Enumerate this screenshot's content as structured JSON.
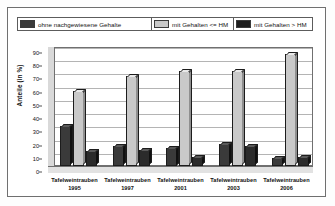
{
  "chart_data": {
    "type": "bar",
    "title": "",
    "subtitle": "",
    "xlabel": "",
    "ylabel": "Anteile (in %)",
    "ylim": [
      0,
      90
    ],
    "yticks": [
      0,
      10,
      20,
      30,
      40,
      50,
      60,
      70,
      80,
      90
    ],
    "grid": true,
    "legend_position": "top",
    "categories": [
      "Tafelweintrauben 1995",
      "Tafelweintrauben 1997",
      "Tafelweintrauben 2001",
      "Tafelweintrauben 2003",
      "Tafelweintrauben 2006"
    ],
    "category_names": [
      "Tafelweintrauben",
      "Tafelweintrauben",
      "Tafelweintrauben",
      "Tafelweintrauben",
      "Tafelweintrauben"
    ],
    "category_years": [
      "1995",
      "1997",
      "2001",
      "2003",
      "2006"
    ],
    "series": [
      {
        "name": "ohne nachgewiesene Gehalte",
        "color": "#3a3a3a",
        "values": [
          30,
          15,
          14,
          17,
          6
        ]
      },
      {
        "name": "mit Gehalten <= HM",
        "color": "#c9c9c9",
        "values": [
          57,
          68,
          72,
          72,
          85
        ]
      },
      {
        "name": "mit Gehalten > HM",
        "color": "#2b2b2b",
        "values": [
          11,
          12,
          7,
          15,
          7
        ]
      }
    ]
  },
  "legend": {
    "items": [
      {
        "label": "ohne nachgewiesene Gehalte",
        "color": "#3a3a3a"
      },
      {
        "label": "mit Gehalten <= HM",
        "color": "#c9c9c9"
      },
      {
        "label": "mit Gehalten > HM",
        "color": "#1e1e1e"
      }
    ]
  },
  "axes": {
    "ylabel": "Anteile (in %)",
    "yticks": [
      "90",
      "80",
      "70",
      "60",
      "50",
      "40",
      "30",
      "20",
      "10",
      "0"
    ]
  }
}
